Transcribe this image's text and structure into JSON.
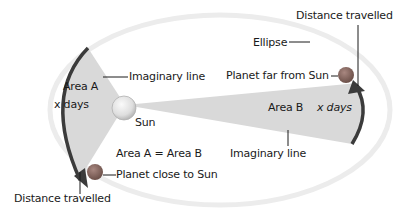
{
  "diagram": {
    "labels": {
      "distance_top": "Distance travelled",
      "ellipse": "Ellipse",
      "planet_far": "Planet far from Sun",
      "area_a": "Area A",
      "x_days_a": "x days",
      "imaginary_line_top": "Imaginary line",
      "sun": "Sun",
      "area_b": "Area B",
      "x_days_b": "x days",
      "equation": "Area A = Area B",
      "imaginary_line_bottom": "Imaginary line",
      "planet_close": "Planet close to Sun",
      "distance_bottom": "Distance travelled"
    },
    "colors": {
      "wedge": "#d9d9d9",
      "arc": "#3b3b3b",
      "planet": "#8c6b63",
      "sun": "#e6e6e6",
      "ellipse": "#ececec"
    }
  }
}
